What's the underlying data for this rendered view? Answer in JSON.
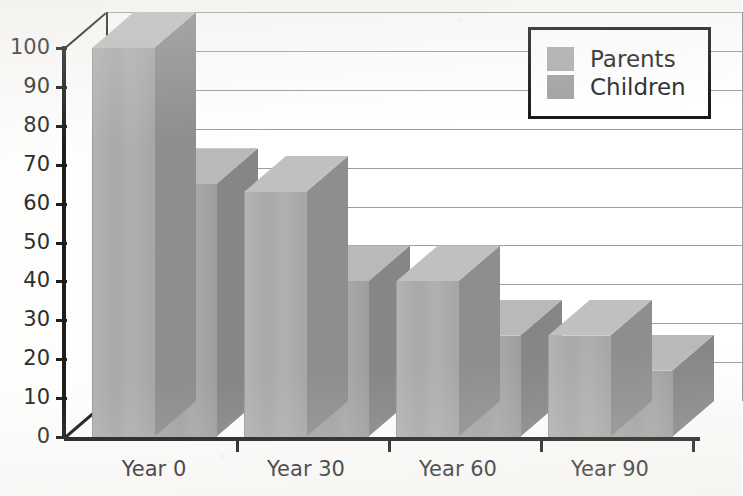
{
  "chart_data": {
    "type": "bar",
    "title": "",
    "subtitle": "",
    "xlabel": "",
    "ylabel": "",
    "categories": [
      "Year 0",
      "Year 30",
      "Year 60",
      "Year 90"
    ],
    "series": [
      {
        "name": "Parents",
        "values": [
          100,
          63,
          40,
          26
        ],
        "color": "#b0b0b0"
      },
      {
        "name": "Children",
        "values": [
          65,
          40,
          26,
          17
        ],
        "color": "#a3a3a3"
      }
    ],
    "ylim": [
      0,
      100
    ],
    "ytick_values": [
      0,
      10,
      20,
      30,
      40,
      50,
      60,
      70,
      80,
      90,
      100
    ],
    "ytick_labels": [
      "0",
      "10",
      "20",
      "30",
      "40",
      "50",
      "60",
      "70",
      "80",
      "90",
      "100"
    ],
    "grid": true,
    "grid_axis": "y",
    "legend_position": "top-right",
    "style": "3d-grouped-bars",
    "annotations": []
  },
  "legend": {
    "entries": [
      {
        "label": "Parents"
      },
      {
        "label": "Children"
      }
    ]
  },
  "axes": {
    "y_ticks": [
      "100",
      "90",
      "80",
      "70",
      "60",
      "50",
      "40",
      "30",
      "20",
      "10",
      "0"
    ],
    "x_ticks": [
      "Year 0",
      "Year 30",
      "Year 60",
      "Year 90"
    ]
  },
  "colors": {
    "bar_front_parents": "#b0b0b0",
    "bar_front_children": "#a3a3a3",
    "bar_side": "#8e8e8e",
    "bar_top": "#c0c0c0",
    "axis": "#1d1d1d",
    "gridline": "#8d8d8d",
    "background": "#fdfdfc"
  }
}
